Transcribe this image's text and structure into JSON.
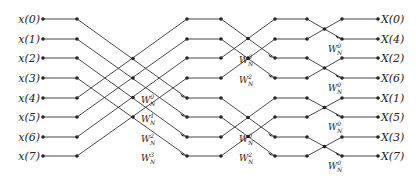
{
  "inputs": [
    "x(0)",
    "x(1)",
    "x(2)",
    "x(3)",
    "x(4)",
    "x(5)",
    "x(6)",
    "x(7)"
  ],
  "outputs": [
    "X(0)",
    "X(4)",
    "X(2)",
    "X(6)",
    "X(1)",
    "X(5)",
    "X(3)",
    "X(7)"
  ],
  "twiddle_base": "W",
  "twiddle_sub": "N",
  "stage1_twiddles": [
    "0",
    "1",
    "2",
    "3"
  ],
  "stage2_twiddles": [
    "0",
    "2",
    "0",
    "2"
  ],
  "stage3_twiddles": [
    "0",
    "0",
    "0",
    "0"
  ],
  "colors": {
    "line": "#333333",
    "node": "#222222",
    "text": "#222222"
  }
}
